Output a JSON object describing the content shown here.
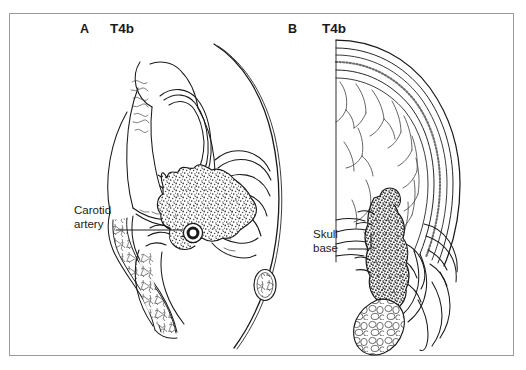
{
  "figure": {
    "frame_color": "#9b9b9b",
    "ink_color": "#1a1a1a",
    "background": "#ffffff"
  },
  "panels": [
    {
      "id": "A",
      "letter": "A",
      "stage": "T4b",
      "view": "axial",
      "annotations": [
        {
          "name": "carotid-artery",
          "line1": "Carotid",
          "line2": "artery",
          "leader": "horizontal"
        }
      ]
    },
    {
      "id": "B",
      "letter": "B",
      "stage": "T4b",
      "view": "coronal",
      "annotations": [
        {
          "name": "skull-base",
          "line1": "Skull",
          "line2": "base",
          "leader": "elbow"
        }
      ]
    }
  ],
  "labels": {
    "panel_a_letter": "A",
    "panel_a_stage": "T4b",
    "panel_b_letter": "B",
    "panel_b_stage": "T4b",
    "carotid_line1": "Carotid",
    "carotid_line2": "artery",
    "skullbase_line1": "Skull",
    "skullbase_line2": "base"
  }
}
